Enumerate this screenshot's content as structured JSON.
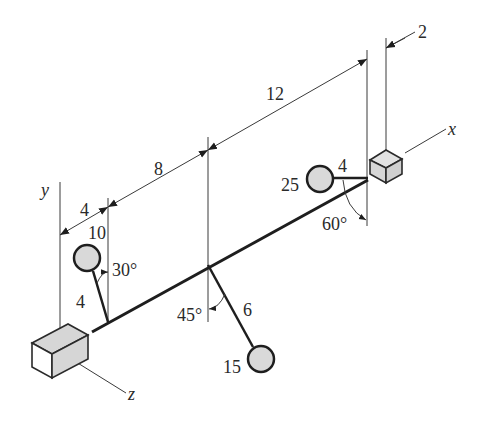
{
  "diagram": {
    "axes": {
      "x": "x",
      "y": "y",
      "z": "z"
    },
    "dimensions": {
      "d1": "4",
      "d2": "8",
      "d3": "12",
      "d4": "2"
    },
    "masses": [
      {
        "id": "mass-10",
        "mass": "10",
        "arm_length": "4",
        "angle": "30°"
      },
      {
        "id": "mass-25",
        "mass": "25",
        "arm_length": "4",
        "angle": "60°"
      },
      {
        "id": "mass-15",
        "mass": "15",
        "arm_length": "6",
        "angle": "45°"
      }
    ],
    "colors": {
      "line": "#1e1e1e",
      "disk_fill": "#d9d9d9",
      "box_fill": "#d6d6d6",
      "background": "#ffffff"
    }
  }
}
